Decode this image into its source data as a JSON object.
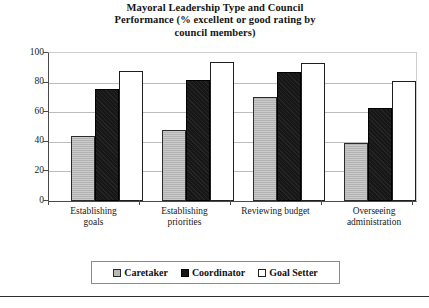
{
  "chart_data": {
    "type": "bar",
    "title": "Mayoral Leadership Type and Council Performance (% excellent or good rating by council members)",
    "title_lines": [
      "Mayoral Leadership Type and Council",
      "Performance (% excellent or good rating by",
      "council members)"
    ],
    "xlabel": "",
    "ylabel": "",
    "ylim": [
      0,
      100
    ],
    "ytick_labels": [
      "0",
      "20",
      "40",
      "60",
      "80",
      "100"
    ],
    "ytick_values": [
      0,
      20,
      40,
      60,
      80,
      100
    ],
    "grid": true,
    "legend_position": "bottom",
    "categories": [
      "Establishing goals",
      "Establishing priorities",
      "Reviewing budget",
      "Overseeing administration"
    ],
    "category_lines": [
      [
        "Establishing",
        "goals"
      ],
      [
        "Establishing",
        "priorities"
      ],
      [
        "Reviewing budget",
        ""
      ],
      [
        "Overseeing",
        "administration"
      ]
    ],
    "series": [
      {
        "name": "Caretaker",
        "color": "#b9b9b9",
        "values": [
          44,
          48,
          70,
          39
        ]
      },
      {
        "name": "Coordinator",
        "color": "#171717",
        "values": [
          76,
          82,
          87,
          63
        ]
      },
      {
        "name": "Goal Setter",
        "color": "#ffffff",
        "values": [
          88,
          94,
          93,
          81
        ]
      }
    ]
  }
}
